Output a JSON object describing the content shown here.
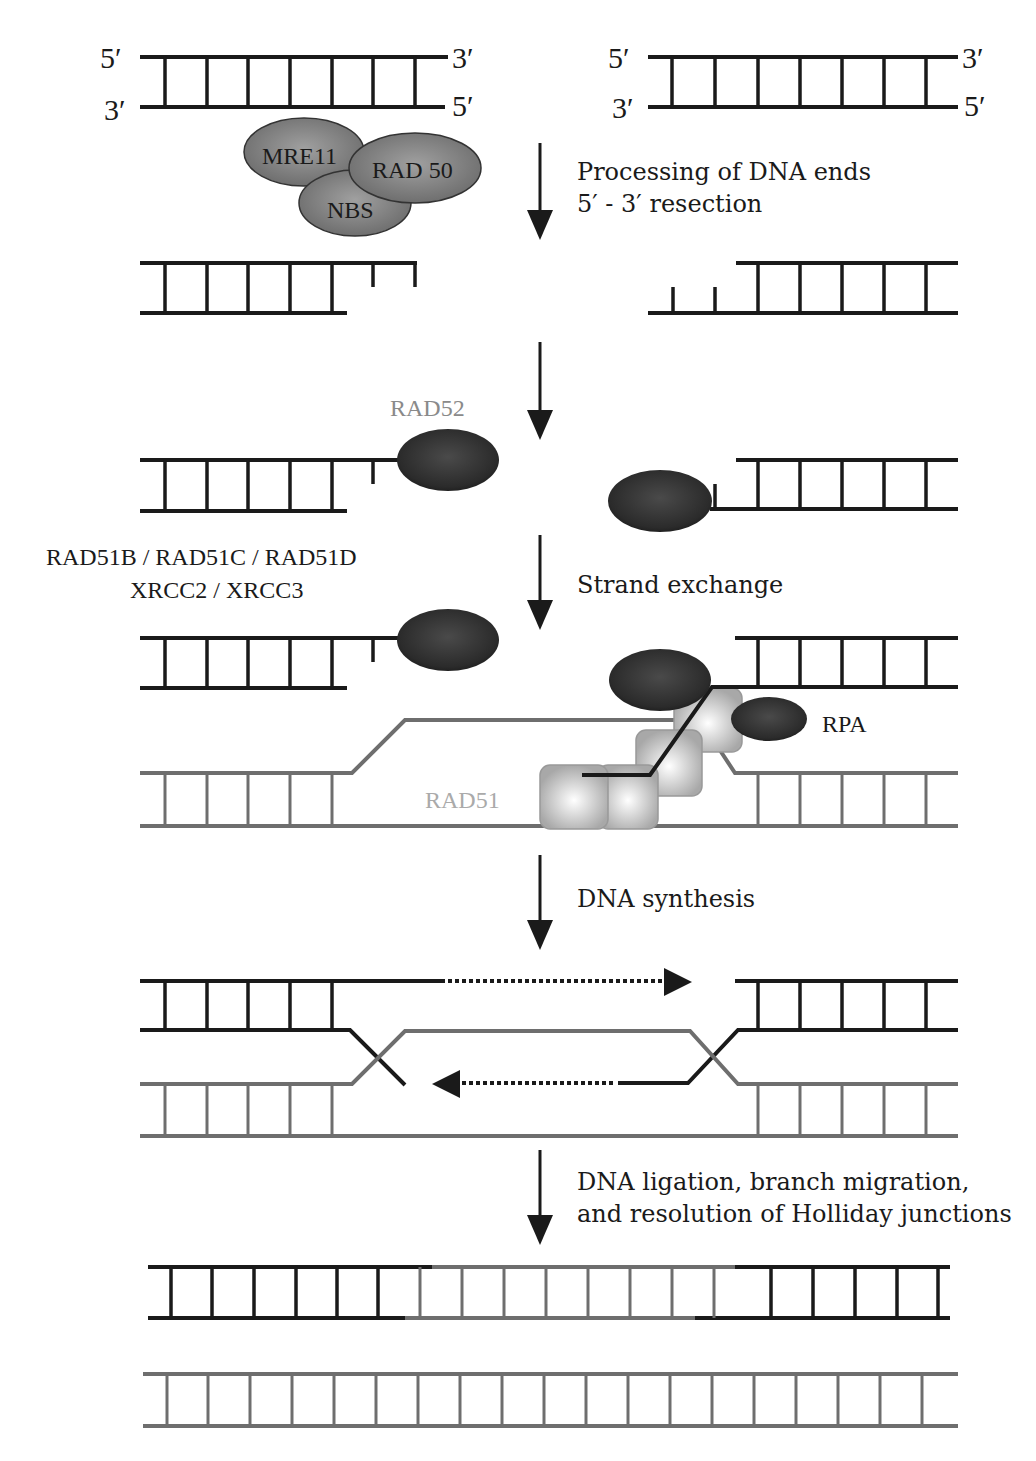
{
  "diagram": {
    "colors": {
      "strand_original": "#1a1a1a",
      "strand_template": "#6e6e6e",
      "protein_dark": "#2e2e2e",
      "protein_mid": "#7a7a7a",
      "rad51": "#bdbdbd",
      "label_rad52": "#8a8a8a",
      "label_rad51": "#aaaaaa"
    },
    "end_labels": {
      "left_top_5": "5′",
      "left_top_3": "3′",
      "left_bottom_3": "3′",
      "left_bottom_5": "5′",
      "right_top_5": "5′",
      "right_top_3": "3′",
      "right_bottom_3": "3′",
      "right_bottom_5": "5′"
    },
    "proteins": {
      "mre11": "MRE11",
      "rad50": "RAD 50",
      "nbs": "NBS",
      "rad52": "RAD52",
      "paralogs_line1": "RAD51B / RAD51C / RAD51D",
      "paralogs_line2": "XRCC2 / XRCC3",
      "rpa": "RPA",
      "rad51": "RAD51"
    },
    "steps": [
      {
        "id": "resection",
        "lines": [
          "Processing of DNA ends",
          "5′ - 3′ resection"
        ]
      },
      {
        "id": "rad52-binding",
        "lines": []
      },
      {
        "id": "strand-exchange",
        "lines": [
          "Strand exchange"
        ]
      },
      {
        "id": "dna-synthesis",
        "lines": [
          "DNA synthesis"
        ]
      },
      {
        "id": "resolution",
        "lines": [
          "DNA ligation, branch migration,",
          "and resolution of Holliday junctions"
        ]
      }
    ]
  }
}
